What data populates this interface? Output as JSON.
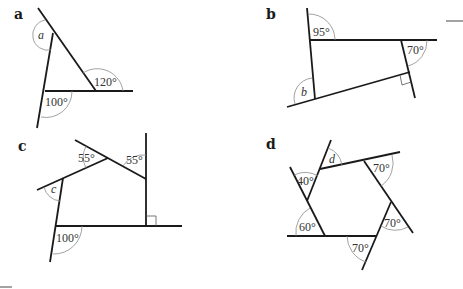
{
  "diagrams": [
    {
      "part": "a",
      "angles": {
        "unknown": "a",
        "exterior_top_right": "120°",
        "exterior_bottom_left": "100°"
      },
      "shape": "triangle"
    },
    {
      "part": "b",
      "angles": {
        "top_left": "95°",
        "top_right": "70°",
        "unknown": "b",
        "bottom_right": "right angle"
      },
      "shape": "quadrilateral"
    },
    {
      "part": "c",
      "angles": {
        "top_middle": "55°",
        "top_right": "55°",
        "unknown": "c",
        "bottom_left": "100°",
        "bottom_right": "right angle"
      },
      "shape": "pentagon"
    },
    {
      "part": "d",
      "angles": {
        "unknown": "d",
        "top_right": "70°",
        "left_upper": "40°",
        "left_lower": "60°",
        "bottom": "70°",
        "right": "70°"
      },
      "shape": "hexagon"
    }
  ],
  "labels": {
    "a": "a",
    "b": "b",
    "c": "c",
    "d": "d",
    "a_var": "a",
    "a_120": "120°",
    "a_100": "100°",
    "b_95": "95°",
    "b_70": "70°",
    "b_var": "b",
    "c_55a": "55°",
    "c_55b": "55°",
    "c_var": "c",
    "c_100": "100°",
    "d_var": "d",
    "d_70a": "70°",
    "d_40": "40°",
    "d_60": "60°",
    "d_70b": "70°",
    "d_70c": "70°"
  }
}
